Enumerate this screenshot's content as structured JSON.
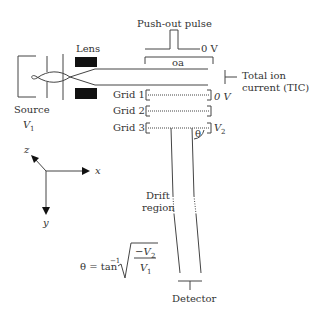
{
  "labels": {
    "push_out_pulse": "Push-out pulse",
    "zero_v_pulse": "0 V",
    "oa": "oa",
    "lens": "Lens",
    "source": "Source",
    "source_voltage": "V",
    "source_voltage_sub": "1",
    "total_ion_current_line1": "Total ion",
    "total_ion_current_line2": "current (TIC)",
    "grid1": "Grid 1",
    "grid2": "Grid 2",
    "grid3": "Grid 3",
    "grid1_voltage": "0 V",
    "grid3_voltage": "V",
    "grid3_voltage_sub": "2",
    "theta": "θ",
    "drift_region_line1": "Drift",
    "drift_region_line2": "region",
    "detector": "Detector",
    "axis_x": "x",
    "axis_y": "y",
    "axis_z": "z"
  },
  "formula": {
    "lhs": "θ = tan",
    "exponent": "−1",
    "numerator": "−V",
    "numerator_sub": "2",
    "denominator": "V",
    "denominator_sub": "1"
  },
  "colors": {
    "stroke": "#444444",
    "fill_dark": "#111111",
    "text": "#333333"
  }
}
